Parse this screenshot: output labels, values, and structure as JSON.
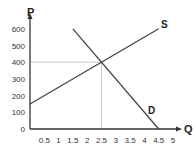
{
  "chart_data": {
    "type": "line",
    "title": "",
    "xlabel": "Q",
    "ylabel": "P",
    "xlim": [
      0,
      5
    ],
    "ylim": [
      0,
      600
    ],
    "x_ticks": [
      "0.5",
      "1",
      "1.5",
      "2",
      "2.5",
      "3",
      "3.5",
      "4",
      "4.5",
      "5"
    ],
    "y_ticks": [
      "0",
      "100",
      "200",
      "300",
      "400",
      "500",
      "600"
    ],
    "grid": false,
    "series": [
      {
        "name": "S",
        "points": [
          [
            0,
            150
          ],
          [
            4.5,
            600
          ]
        ]
      },
      {
        "name": "D",
        "points": [
          [
            1.5,
            600
          ],
          [
            4.5,
            0
          ]
        ]
      }
    ],
    "equilibrium": {
      "q": 2.5,
      "p": 400
    },
    "guide_lines": [
      {
        "from": [
          0,
          400
        ],
        "to": [
          2.5,
          400
        ]
      },
      {
        "from": [
          2.5,
          400
        ],
        "to": [
          2.5,
          0
        ]
      }
    ],
    "annotations": [
      "S",
      "D"
    ]
  },
  "labels": {
    "p_axis": "P",
    "q_axis": "Q",
    "supply": "S",
    "demand": "D"
  }
}
